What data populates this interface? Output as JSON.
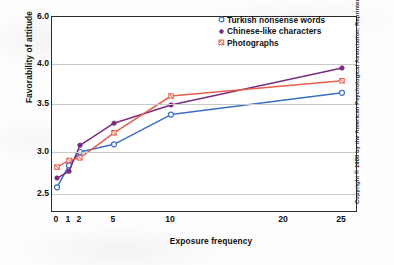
{
  "chart_data": {
    "type": "line",
    "title": "",
    "xlabel": "Exposure frequency",
    "ylabel": "Favorability of attitude",
    "x": [
      0,
      1,
      2,
      5,
      10,
      25
    ],
    "xticks": [
      "0",
      "1",
      "2",
      "5",
      "10",
      "20",
      "25"
    ],
    "xtick_values": [
      0,
      1,
      2,
      5,
      10,
      20,
      25
    ],
    "yticks": [
      "2.5",
      "3.0",
      "3.5",
      "4.0",
      "6.0"
    ],
    "ytick_values": [
      2.5,
      3.0,
      3.5,
      4.0,
      6.0
    ],
    "ylim": [
      2.28,
      6.0
    ],
    "grid": "horizontal",
    "legend_position": "top-right",
    "series": [
      {
        "name": "Turkish nonsense words",
        "color": "#3b6fc4",
        "marker": "open-circle",
        "x": [
          0,
          1,
          2,
          5,
          10,
          25
        ],
        "values": [
          2.58,
          2.84,
          3.0,
          3.08,
          3.39,
          3.64
        ]
      },
      {
        "name": "Chinese-like characters",
        "color": "#7a2d7e",
        "marker": "filled-circle",
        "x": [
          0,
          1,
          2,
          5,
          10,
          25
        ],
        "values": [
          2.69,
          2.77,
          3.07,
          3.3,
          3.49,
          3.95
        ]
      },
      {
        "name": "Photographs",
        "color": "#e8604c",
        "marker": "cross-square",
        "x": [
          0,
          1,
          2,
          5,
          10,
          25
        ],
        "values": [
          2.82,
          2.9,
          2.93,
          3.2,
          3.6,
          3.79
        ]
      }
    ]
  },
  "legend": {
    "items": [
      {
        "label": "Turkish nonsense words",
        "marker": "open-circle",
        "color": "#3b6fc4"
      },
      {
        "label": "Chinese-like characters",
        "marker": "filled-circle",
        "color": "#7a2d7e"
      },
      {
        "label": "Photographs",
        "marker": "cross-square",
        "color": "#e8604c"
      }
    ]
  },
  "credit": {
    "text": "Copyright © 1988 by the American Psychological Association. Reprinted by"
  }
}
